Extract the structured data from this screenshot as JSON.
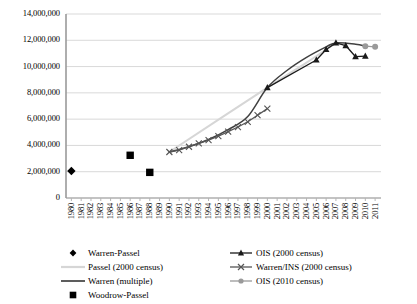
{
  "chart_data": {
    "type": "line",
    "title": "",
    "xlabel": "",
    "ylabel": "",
    "ylim": [
      0,
      14000000
    ],
    "ytick_labels": [
      "0",
      "2,000,000",
      "4,000,000",
      "6,000,000",
      "8,000,000",
      "10,000,000",
      "12,000,000",
      "14,000,000"
    ],
    "ytick_values": [
      0,
      2000000,
      4000000,
      6000000,
      8000000,
      10000000,
      12000000,
      14000000
    ],
    "grid": true,
    "legend_position": "below",
    "categories": [
      "1980",
      "1981",
      "1982",
      "1983",
      "1984",
      "1985",
      "1986",
      "1987",
      "1988",
      "1989",
      "1990",
      "1991",
      "1992",
      "1993",
      "1994",
      "1995",
      "1996",
      "1997",
      "1998",
      "1999",
      "2000",
      "2001",
      "2002",
      "2003",
      "2004",
      "2005",
      "2006",
      "2007",
      "2008",
      "2009",
      "2010",
      "2011"
    ],
    "series": [
      {
        "name": "Warren-Passel",
        "marker": "diamond",
        "color": "#000000",
        "points": [
          {
            "x": "1980",
            "y": 2050000
          }
        ]
      },
      {
        "name": "Woodrow-Passel",
        "marker": "square",
        "color": "#000000",
        "points": [
          {
            "x": "1986",
            "y": 3250000
          },
          {
            "x": "1988",
            "y": 1950000
          }
        ]
      },
      {
        "name": "Passel (2000 census)",
        "marker": "line",
        "color": "#d6d6d6",
        "points": [
          {
            "x": "1990",
            "y": 3500000
          },
          {
            "x": "2000",
            "y": 8400000
          },
          {
            "x": "2004",
            "y": 10300000
          },
          {
            "x": "2007",
            "y": 11800000
          }
        ]
      },
      {
        "name": "Warren (multiple)",
        "marker": "line",
        "color": "#404040",
        "points": [
          {
            "x": "1990",
            "y": 3500000
          },
          {
            "x": "1992",
            "y": 3900000
          },
          {
            "x": "1994",
            "y": 4450000
          },
          {
            "x": "1996",
            "y": 5200000
          },
          {
            "x": "1998",
            "y": 6200000
          },
          {
            "x": "2000",
            "y": 8400000
          },
          {
            "x": "2002",
            "y": 9700000
          },
          {
            "x": "2004",
            "y": 10700000
          },
          {
            "x": "2006",
            "y": 11500000
          },
          {
            "x": "2007",
            "y": 11800000
          },
          {
            "x": "2009",
            "y": 11700000
          },
          {
            "x": "2010",
            "y": 11550000
          }
        ]
      },
      {
        "name": "OIS (2000 census)",
        "marker": "triangle",
        "color": "#1a1a1a",
        "points": [
          {
            "x": "2000",
            "y": 8400000
          },
          {
            "x": "2005",
            "y": 10500000
          },
          {
            "x": "2006",
            "y": 11300000
          },
          {
            "x": "2007",
            "y": 11800000
          },
          {
            "x": "2008",
            "y": 11600000
          },
          {
            "x": "2009",
            "y": 10750000
          },
          {
            "x": "2010",
            "y": 10800000
          }
        ]
      },
      {
        "name": "Warren/INS (2000 census)",
        "marker": "x",
        "color": "#555555",
        "points": [
          {
            "x": "1990",
            "y": 3500000
          },
          {
            "x": "1991",
            "y": 3650000
          },
          {
            "x": "1992",
            "y": 3900000
          },
          {
            "x": "1993",
            "y": 4150000
          },
          {
            "x": "1994",
            "y": 4400000
          },
          {
            "x": "1995",
            "y": 4700000
          },
          {
            "x": "1996",
            "y": 5050000
          },
          {
            "x": "1997",
            "y": 5400000
          },
          {
            "x": "1998",
            "y": 5800000
          },
          {
            "x": "1999",
            "y": 6300000
          },
          {
            "x": "2000",
            "y": 6800000
          }
        ]
      },
      {
        "name": "OIS (2010 census)",
        "marker": "dot",
        "color": "#9a9a9a",
        "points": [
          {
            "x": "2010",
            "y": 11550000
          },
          {
            "x": "2011",
            "y": 11500000
          }
        ]
      }
    ]
  },
  "legend": {
    "left_items": [
      {
        "label": "Warren-Passel",
        "marker": "diamond",
        "color": "#000000"
      },
      {
        "label": "Passel (2000 census)",
        "marker": "line",
        "color": "#d6d6d6"
      },
      {
        "label": "Warren (multiple)",
        "marker": "line",
        "color": "#404040"
      },
      {
        "label": "Woodrow-Passel",
        "marker": "square",
        "color": "#000000"
      }
    ],
    "right_items": [
      {
        "label": "OIS (2000 census)",
        "marker": "line-triangle",
        "color": "#1a1a1a"
      },
      {
        "label": "Warren/INS (2000 census)",
        "marker": "line-x",
        "color": "#555555"
      },
      {
        "label": "OIS (2010 census)",
        "marker": "line-dot",
        "color": "#9a9a9a"
      }
    ]
  }
}
